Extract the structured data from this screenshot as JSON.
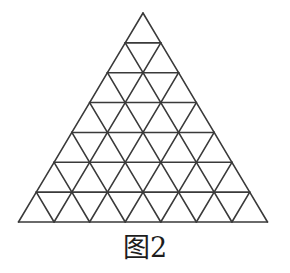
{
  "figure": {
    "caption": "图2",
    "caption_label": "figure-2-caption",
    "background_color": "#ffffff",
    "line_color": "#3a3a3a",
    "line_width": 1.6
  },
  "diagram": {
    "type": "triangular-lattice",
    "name": "subdivided-equilateral-triangle",
    "rows": 7,
    "apex": {
      "x": 143,
      "y": 13
    },
    "base_left": {
      "x": 18,
      "y": 222
    },
    "base_right": {
      "x": 267,
      "y": 222
    },
    "width": 249,
    "height": 209,
    "row_height": 29.857,
    "cell_half_width": 17.786,
    "counts": {
      "upward_triangles": 49,
      "downward_triangles": 36,
      "total_unit_triangles": 85,
      "rows_description": [
        {
          "row": 1,
          "upward": 1,
          "downward": 0,
          "total": 1
        },
        {
          "row": 2,
          "upward": 2,
          "downward": 1,
          "total": 3
        },
        {
          "row": 3,
          "upward": 3,
          "downward": 2,
          "total": 5
        },
        {
          "row": 4,
          "upward": 4,
          "downward": 3,
          "total": 7
        },
        {
          "row": 5,
          "upward": 5,
          "downward": 4,
          "total": 9
        },
        {
          "row": 6,
          "upward": 6,
          "downward": 5,
          "total": 11
        },
        {
          "row": 7,
          "upward": 7,
          "downward": 6,
          "total": 13
        }
      ]
    },
    "horizontal_line_y": [
      13,
      42.86,
      72.71,
      102.57,
      132.43,
      162.29,
      192.14,
      222
    ]
  }
}
